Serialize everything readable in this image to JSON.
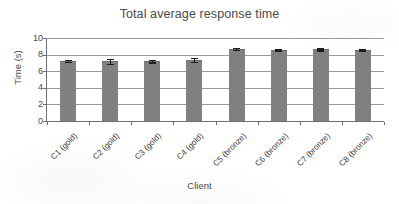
{
  "chart_data": {
    "type": "bar",
    "title": "Total average response time",
    "xlabel": "Client",
    "ylabel": "Time (s)",
    "ylim": [
      0,
      10
    ],
    "ytick_values": [
      10,
      8,
      6,
      4,
      2,
      0
    ],
    "ytick_labels": [
      "10",
      "8",
      "6",
      "4",
      "2",
      "0"
    ],
    "grid": true,
    "legend": "none",
    "bar_color": "#808080",
    "errorbar_color": "#1d1d1d",
    "categories": [
      "C1 (gold)",
      "C2 (gold)",
      "C3 (gold)",
      "C4 (gold)",
      "C5 (bronze)",
      "C6 (bronze)",
      "C7 (bronze)",
      "C8 (bronze)"
    ],
    "values": [
      7.25,
      7.2,
      7.25,
      7.4,
      8.7,
      8.6,
      8.65,
      8.6
    ],
    "errors": [
      0.1,
      0.3,
      0.15,
      0.25,
      0.1,
      0.1,
      0.1,
      0.1
    ]
  },
  "axes": {
    "y_title": "Time (s)",
    "x_title": "Client"
  }
}
